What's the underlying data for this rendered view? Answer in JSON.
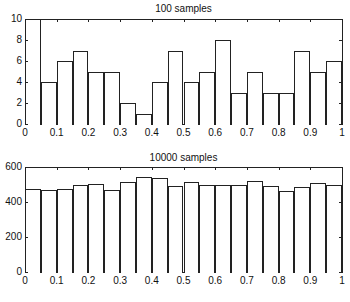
{
  "chart_data": [
    {
      "type": "bar",
      "title": "100 samples",
      "xlabel": "",
      "ylabel": "",
      "xlim": [
        0,
        1
      ],
      "ylim": [
        0,
        10
      ],
      "bin_width": 0.05,
      "categories": [
        0.025,
        0.075,
        0.125,
        0.175,
        0.225,
        0.275,
        0.325,
        0.375,
        0.425,
        0.475,
        0.525,
        0.575,
        0.625,
        0.675,
        0.725,
        0.775,
        0.825,
        0.875,
        0.925,
        0.975
      ],
      "values": [
        10,
        4,
        6,
        7,
        5,
        5,
        2,
        1,
        4,
        7,
        4,
        5,
        8,
        3,
        5,
        3,
        3,
        7,
        5,
        6
      ],
      "xticks": [
        "0",
        "0.1",
        "0.2",
        "0.3",
        "0.4",
        "0.5",
        "0.6",
        "0.7",
        "0.8",
        "0.9",
        "1"
      ],
      "yticks": [
        "0",
        "2",
        "4",
        "6",
        "8",
        "10"
      ],
      "grid": false,
      "legend": null
    },
    {
      "type": "bar",
      "title": "10000 samples",
      "xlabel": "",
      "ylabel": "",
      "xlim": [
        0,
        1
      ],
      "ylim": [
        0,
        600
      ],
      "bin_width": 0.05,
      "categories": [
        0.025,
        0.075,
        0.125,
        0.175,
        0.225,
        0.275,
        0.325,
        0.375,
        0.425,
        0.475,
        0.525,
        0.575,
        0.625,
        0.675,
        0.725,
        0.775,
        0.825,
        0.875,
        0.925,
        0.975
      ],
      "values": [
        475,
        470,
        475,
        500,
        505,
        470,
        515,
        545,
        540,
        490,
        515,
        495,
        500,
        495,
        520,
        490,
        465,
        485,
        510,
        495
      ],
      "xticks": [
        "0",
        "0.1",
        "0.2",
        "0.3",
        "0.4",
        "0.5",
        "0.6",
        "0.7",
        "0.8",
        "0.9",
        "1"
      ],
      "yticks": [
        "0",
        "200",
        "400",
        "600"
      ],
      "grid": false,
      "legend": null
    }
  ],
  "plots": [
    {
      "title": "100 samples"
    },
    {
      "title": "10000 samples"
    }
  ]
}
